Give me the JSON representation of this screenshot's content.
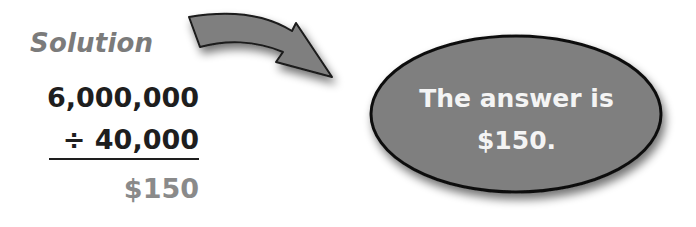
{
  "solution": {
    "label": "Solution",
    "dividend": "6,000,000",
    "divisor": "÷ 40,000",
    "quotient": "$150"
  },
  "arrow": {
    "icon": "curved-arrow-icon",
    "color": "#7f7f7f"
  },
  "bubble": {
    "line1": "The answer is",
    "line2": "$150.",
    "fill": "#7f7f7f",
    "text_color": "#f4f4f4"
  }
}
